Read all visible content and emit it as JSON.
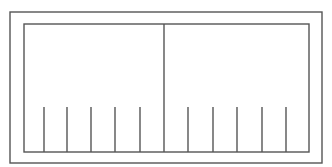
{
  "diagram": {
    "stroke_color": "#555555",
    "background": "#ffffff",
    "outer_frame": {
      "x": 10,
      "y": 12,
      "width": 312,
      "height": 151
    },
    "inner_frame": {
      "x": 24,
      "y": 24,
      "width": 285,
      "height": 128
    },
    "center_divider_x": 164,
    "slat_top_y": 107,
    "slat_bottom_y": 152,
    "left_panel_slats_x": [
      44,
      67,
      91,
      115,
      140
    ],
    "right_panel_slats_x": [
      188,
      213,
      237,
      262,
      286
    ]
  }
}
